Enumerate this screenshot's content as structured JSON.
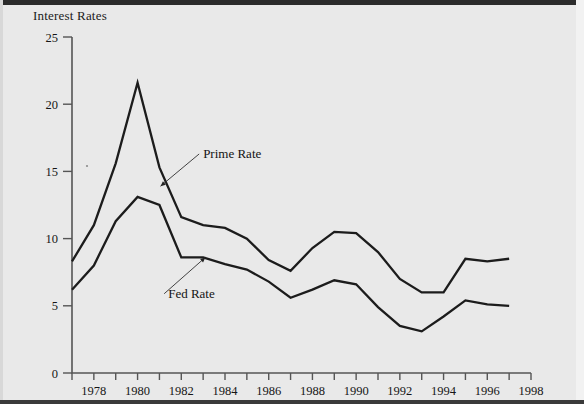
{
  "figure": {
    "title": "Interest Rates",
    "background_color": "#e9e9e9",
    "ink_color": "#1c1c1c",
    "axis_color": "#555555"
  },
  "annotations": [
    {
      "name": "prime-rate-label",
      "text": "Prime Rate",
      "x": 1983.0,
      "y": 16.0
    },
    {
      "name": "fed-rate-label",
      "text": "Fed Rate",
      "x": 1981.4,
      "y": 5.6
    }
  ],
  "chart_data": {
    "type": "line",
    "title": "Interest Rates",
    "xlabel": "",
    "ylabel": "Interest Rates",
    "xlim": [
      1977,
      1998
    ],
    "ylim": [
      0,
      25
    ],
    "ytick_values": [
      0,
      5,
      10,
      15,
      20,
      25
    ],
    "ytick_labels": [
      "0",
      "5",
      "10",
      "15",
      "20",
      "25"
    ],
    "xtick_values": [
      1977,
      1978,
      1979,
      1980,
      1981,
      1982,
      1983,
      1984,
      1985,
      1986,
      1987,
      1988,
      1989,
      1990,
      1991,
      1992,
      1993,
      1994,
      1995,
      1996,
      1997,
      1998
    ],
    "xtick_labels": [
      "",
      "1978",
      "",
      "1980",
      "",
      "1982",
      "",
      "1984",
      "",
      "1986",
      "",
      "1988",
      "",
      "1990",
      "",
      "1992",
      "",
      "1994",
      "",
      "1996",
      "",
      "1998"
    ],
    "grid": false,
    "legend": "inline-annotations",
    "x": [
      1977,
      1978,
      1979,
      1980,
      1981,
      1982,
      1983,
      1984,
      1985,
      1986,
      1987,
      1988,
      1989,
      1990,
      1991,
      1992,
      1993,
      1994,
      1995,
      1996,
      1997
    ],
    "series": [
      {
        "name": "Prime Rate",
        "values": [
          8.3,
          11.0,
          15.6,
          21.6,
          15.3,
          11.6,
          11.0,
          10.8,
          10.0,
          8.4,
          7.6,
          9.3,
          10.5,
          10.4,
          9.0,
          7.0,
          6.0,
          6.0,
          8.5,
          8.3,
          8.5
        ]
      },
      {
        "name": "Fed Rate",
        "values": [
          6.2,
          8.0,
          11.3,
          13.1,
          12.5,
          8.6,
          8.6,
          8.1,
          7.7,
          6.8,
          5.6,
          6.2,
          6.9,
          6.6,
          4.9,
          3.5,
          3.1,
          4.2,
          5.4,
          5.1,
          5.0
        ]
      }
    ]
  }
}
